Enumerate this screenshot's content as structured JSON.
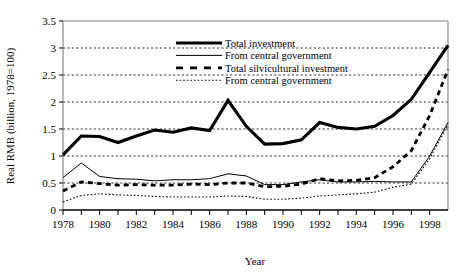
{
  "chart_data": {
    "type": "line",
    "title": "",
    "xlabel": "Year",
    "ylabel": "Real RMB (billion, 1978=100)",
    "xlim": [
      1978,
      1999
    ],
    "ylim": [
      0,
      3.5
    ],
    "yticks": [
      "0",
      "0.5",
      "1",
      "1.5",
      "2",
      "2.5",
      "3",
      "3.5"
    ],
    "ytick_values": [
      0,
      0.5,
      1,
      1.5,
      2,
      2.5,
      3,
      3.5
    ],
    "xticks": [
      "1978",
      "1980",
      "1982",
      "1984",
      "1986",
      "1988",
      "1990",
      "1992",
      "1994",
      "1996",
      "1998"
    ],
    "xtick_values": [
      1978,
      1980,
      1982,
      1984,
      1986,
      1988,
      1990,
      1992,
      1994,
      1996,
      1998
    ],
    "x": [
      1978,
      1979,
      1980,
      1981,
      1982,
      1983,
      1984,
      1985,
      1986,
      1987,
      1988,
      1989,
      1990,
      1991,
      1992,
      1993,
      1994,
      1995,
      1996,
      1997,
      1998,
      1999
    ],
    "grid": "horizontal",
    "legend_position": "upper-center",
    "series": [
      {
        "name": "Total investment",
        "style": "thick-solid",
        "color": "#000000",
        "values": [
          1.02,
          1.37,
          1.36,
          1.25,
          1.37,
          1.48,
          1.44,
          1.52,
          1.47,
          2.03,
          1.55,
          1.22,
          1.23,
          1.3,
          1.62,
          1.53,
          1.5,
          1.55,
          1.75,
          2.05,
          2.55,
          3.05
        ]
      },
      {
        "name": "From central government",
        "style": "thin-solid",
        "color": "#000000",
        "values": [
          0.6,
          0.87,
          0.62,
          0.58,
          0.57,
          0.54,
          0.56,
          0.56,
          0.58,
          0.67,
          0.63,
          0.47,
          0.47,
          0.52,
          0.56,
          0.52,
          0.52,
          0.53,
          0.52,
          0.52,
          1.0,
          1.62
        ]
      },
      {
        "name": "Total silvicultural investment",
        "style": "dashed",
        "color": "#000000",
        "values": [
          0.35,
          0.52,
          0.49,
          0.46,
          0.47,
          0.46,
          0.46,
          0.48,
          0.47,
          0.5,
          0.5,
          0.43,
          0.44,
          0.48,
          0.58,
          0.54,
          0.55,
          0.6,
          0.8,
          1.1,
          1.75,
          2.6
        ]
      },
      {
        "name": "From central government",
        "style": "dotted",
        "color": "#000000",
        "values": [
          0.15,
          0.27,
          0.3,
          0.28,
          0.27,
          0.25,
          0.24,
          0.24,
          0.24,
          0.26,
          0.25,
          0.2,
          0.2,
          0.22,
          0.26,
          0.28,
          0.3,
          0.33,
          0.42,
          0.48,
          0.95,
          1.58
        ]
      }
    ],
    "legend": [
      {
        "label": "Total investment",
        "style": "thick-solid"
      },
      {
        "label": "From central government",
        "style": "thin-solid"
      },
      {
        "label": "Total silvicultural investment",
        "style": "dashed"
      },
      {
        "label": "From central government",
        "style": "dotted"
      }
    ]
  }
}
